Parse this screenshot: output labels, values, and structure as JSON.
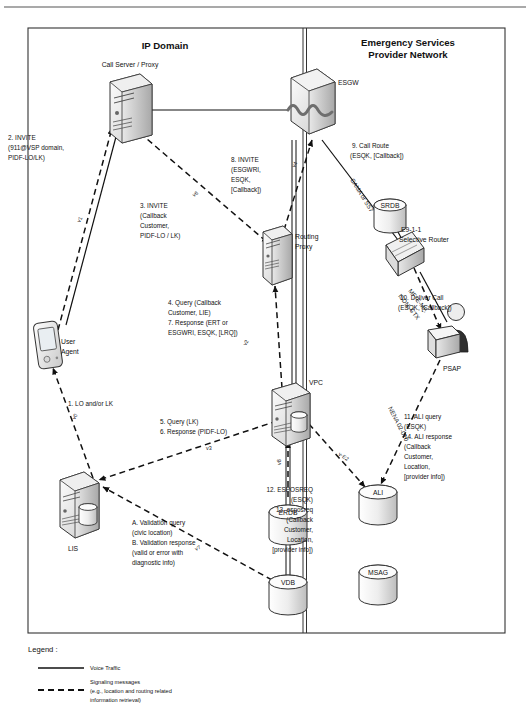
{
  "page": {
    "header_rule": true,
    "background": "#ffffff",
    "line_color": "#222222"
  },
  "domains": [
    {
      "id": "ip-domain",
      "label": "IP Domain"
    },
    {
      "id": "esp-network",
      "label": "Emergency Services\nProvider Network",
      "line1": "Emergency Services",
      "line2": "Provider Network"
    }
  ],
  "nodes": [
    {
      "id": "call-server",
      "label": "Call Server / Proxy",
      "type": "server",
      "x": 118,
      "y": 95
    },
    {
      "id": "esgw",
      "label": "ESGW",
      "type": "gateway",
      "x": 310,
      "y": 95
    },
    {
      "id": "routing-proxy",
      "label": "Routing\nProxy",
      "type": "server",
      "x": 276,
      "y": 240,
      "line1": "Routing",
      "line2": "Proxy"
    },
    {
      "id": "srdb",
      "label": "SRDB",
      "type": "database",
      "x": 390,
      "y": 212
    },
    {
      "id": "selective-router",
      "label": "E9-1-1\nSelective Router",
      "type": "router",
      "x": 408,
      "y": 244,
      "line1": "E9-1-1",
      "line2": "Selective Router"
    },
    {
      "id": "user-agent",
      "label": "User\nAgent",
      "type": "phone",
      "x": 46,
      "y": 345,
      "line1": "User",
      "line2": "Agent"
    },
    {
      "id": "vpc",
      "label": "VPC",
      "type": "server",
      "x": 292,
      "y": 400
    },
    {
      "id": "psap",
      "label": "PSAP",
      "type": "operator",
      "x": 452,
      "y": 335
    },
    {
      "id": "lis",
      "label": "LIS",
      "type": "server",
      "x": 76,
      "y": 505
    },
    {
      "id": "erdb",
      "label": "ERDB",
      "type": "database",
      "x": 290,
      "y": 520
    },
    {
      "id": "ali",
      "label": "ALI",
      "type": "database",
      "x": 378,
      "y": 500
    },
    {
      "id": "vdb",
      "label": "VDB",
      "type": "database",
      "x": 290,
      "y": 590
    },
    {
      "id": "msag",
      "label": "MSAG",
      "type": "database",
      "x": 378,
      "y": 580
    }
  ],
  "messages": [
    {
      "id": "m2",
      "lines": [
        "2. INVITE",
        "(911@VSP domain,",
        "PIDF-LO/LK)"
      ],
      "x": 8,
      "y": 140
    },
    {
      "id": "m3",
      "lines": [
        "3. INVITE",
        "(Callback",
        "Customer,",
        "PIDF-LO / LK)"
      ],
      "x": 140,
      "y": 208
    },
    {
      "id": "m8",
      "lines": [
        "8. INVITE",
        "(ESGWRI,",
        "ESQK,",
        "[Callback])"
      ],
      "x": 231,
      "y": 162
    },
    {
      "id": "m9",
      "lines": [
        "9. Call Route",
        "(ESQK, [Callback])"
      ],
      "x": 352,
      "y": 148
    },
    {
      "id": "m4_7",
      "lines": [
        "4. Query (Callback",
        "Customer, LIE)",
        "7. Response (ERT or",
        "ESGWRI, ESQK, [LRQ])"
      ],
      "x": 168,
      "y": 305
    },
    {
      "id": "m1",
      "lines": [
        "1. LO and/or LK"
      ],
      "x": 68,
      "y": 406
    },
    {
      "id": "m5_6",
      "lines": [
        "5. Query (LK)",
        "6. Response (PIDF-LO)"
      ],
      "x": 160,
      "y": 424
    },
    {
      "id": "m10",
      "lines": [
        "10. Deliver Call",
        "(ESQK, [Callback])"
      ],
      "x": 400,
      "y": 300
    },
    {
      "id": "m11_14",
      "lines": [
        "11. ALI query",
        "(ESQK)",
        "14. ALI response",
        "(Callback",
        "Customer,",
        "Location,",
        "[provider info])"
      ],
      "x": 404,
      "y": 419
    },
    {
      "id": "m12_13",
      "lines": [
        "12. ESPOSREQ",
        "(ESQK)",
        "13. esposreq",
        "(Callback",
        "Customer,",
        "Location,",
        "[provider info])"
      ],
      "x": 313,
      "y": 492,
      "align": "end"
    },
    {
      "id": "mAB",
      "lines": [
        "A. Validation query",
        "(civic location)",
        "B. Validation response",
        "(valid or error with",
        "diagnostic info)"
      ],
      "x": 132,
      "y": 525
    }
  ],
  "edge_labels": [
    {
      "id": "v0",
      "text": "v0",
      "x": 75,
      "y": 420,
      "rotate": -62
    },
    {
      "id": "v1",
      "text": "v1",
      "x": 80,
      "y": 223,
      "rotate": -64
    },
    {
      "id": "v2",
      "text": "v2",
      "x": 246,
      "y": 346,
      "rotate": -60
    },
    {
      "id": "v3",
      "text": "v3",
      "x": 206,
      "y": 450,
      "rotate": 0
    },
    {
      "id": "v4",
      "text": "v4",
      "x": 295,
      "y": 168,
      "rotate": -64
    },
    {
      "id": "v6",
      "text": "v6",
      "x": 194,
      "y": 197,
      "rotate": -36
    },
    {
      "id": "v7",
      "text": "v7",
      "x": 196,
      "y": 551,
      "rotate": -27
    },
    {
      "id": "v8",
      "text": "v8",
      "x": 281,
      "y": 465,
      "rotate": -90
    },
    {
      "id": "vE2",
      "text": "v-E2",
      "x": 338,
      "y": 455,
      "rotate": 33
    }
  ],
  "path_labels": [
    {
      "id": "cama-ss7",
      "text": "CAMA or SS7",
      "x": 350,
      "y": 180,
      "rotate": 58
    },
    {
      "id": "mf-emf",
      "text": "MF, E-MF,",
      "x": 408,
      "y": 291,
      "rotate": 52
    },
    {
      "id": "isdn-ctx",
      "text": "ISDN, CTX",
      "x": 398,
      "y": 296,
      "rotate": 52
    },
    {
      "id": "nena",
      "text": "NENA 02-010",
      "x": 388,
      "y": 408,
      "rotate": 63
    }
  ],
  "legend": {
    "title": "Legend :",
    "items": [
      {
        "id": "voice-traffic",
        "style": "solid",
        "lines": [
          "Voice Traffic"
        ]
      },
      {
        "id": "signaling-messages",
        "style": "dashed",
        "lines": [
          "Signaling messages",
          "(e.g., location and routing related",
          "information retrieval)"
        ]
      }
    ]
  }
}
